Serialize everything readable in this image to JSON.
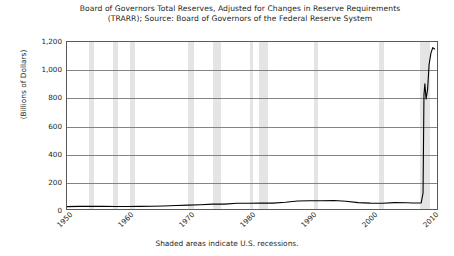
{
  "chart_data": {
    "type": "line",
    "title": "Board of Governors Total Reserves, Adjusted for Changes in Reserve Requirements",
    "subtitle": "(TRARR); Source: Board of Governors of the Federal Reserve System",
    "xlabel": "",
    "ylabel": "(Billions of Dollars)",
    "footnote": "Shaded areas indicate U.S. recessions.",
    "xlim": [
      1950,
      2011
    ],
    "ylim": [
      0,
      1200
    ],
    "yticks": [
      0,
      200,
      400,
      600,
      800,
      1000,
      1200
    ],
    "ytick_labels": [
      "0",
      "200",
      "400",
      "600",
      "800",
      "1,000",
      "1,200"
    ],
    "xticks": [
      1950,
      1960,
      1970,
      1980,
      1990,
      2000,
      2010
    ],
    "xtick_labels": [
      "1950",
      "1960",
      "1970",
      "1980",
      "1990",
      "2000",
      "2010"
    ],
    "grid": "horizontal",
    "legend": "none",
    "series": [
      {
        "name": "Total Reserves, Adjusted (TRARR)",
        "color": "#000000",
        "x": [
          1950,
          1952,
          1954,
          1956,
          1958,
          1960,
          1962,
          1964,
          1966,
          1968,
          1970,
          1972,
          1974,
          1976,
          1978,
          1980,
          1982,
          1984,
          1986,
          1988,
          1990,
          1992,
          1994,
          1996,
          1998,
          2000,
          2002,
          2004,
          2006,
          2007,
          2008.4,
          2008.7,
          2008.85,
          2009.0,
          2009.2,
          2009.45,
          2009.7,
          2010.0,
          2010.3,
          2010.6
        ],
        "y": [
          17,
          19,
          19,
          19,
          18,
          18,
          19,
          20,
          22,
          25,
          28,
          31,
          35,
          35,
          41,
          41,
          42,
          42,
          48,
          58,
          59,
          59,
          61,
          56,
          46,
          42,
          41,
          46,
          45,
          43,
          44,
          115,
          820,
          900,
          790,
          860,
          1040,
          1120,
          1160,
          1150
        ]
      }
    ],
    "recession_bands": [
      {
        "start": 1953.6,
        "end": 1954.4
      },
      {
        "start": 1957.6,
        "end": 1958.3
      },
      {
        "start": 1960.3,
        "end": 1961.1
      },
      {
        "start": 1969.9,
        "end": 1970.9
      },
      {
        "start": 1973.9,
        "end": 1975.2
      },
      {
        "start": 1980.0,
        "end": 1980.5
      },
      {
        "start": 1981.5,
        "end": 1982.9
      },
      {
        "start": 1990.5,
        "end": 1991.2
      },
      {
        "start": 2001.2,
        "end": 2001.9
      },
      {
        "start": 2007.9,
        "end": 2009.5
      }
    ],
    "colors": {
      "line": "#000000",
      "recession_band": "#d9d9d9",
      "axis": "#58595b",
      "gridline": "#6d6e71",
      "text": "#231f20",
      "background": "#ffffff"
    }
  }
}
